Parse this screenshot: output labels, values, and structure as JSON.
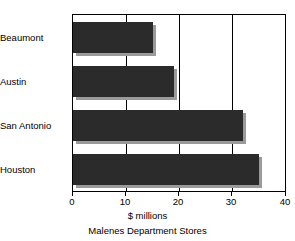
{
  "chart_data": {
    "type": "bar",
    "orientation": "horizontal",
    "title": "",
    "caption": "Malenes Department Stores",
    "xlabel": "$ millions",
    "ylabel": "",
    "categories": [
      "Beaumont",
      "Austin",
      "San Antonio",
      "Houston"
    ],
    "values": [
      15,
      19,
      32,
      35
    ],
    "xlim": [
      0,
      40
    ],
    "xticks": [
      0,
      10,
      20,
      30,
      40
    ],
    "xtick_labels": [
      "0",
      "10",
      "20",
      "30",
      "40"
    ],
    "grid": true,
    "grid_axis": "x",
    "legend": "none",
    "series": [
      {
        "name": "Sales",
        "values": [
          15,
          19,
          32,
          35
        ]
      }
    ],
    "colors": {
      "bar_fill": "#2b2b2b",
      "bar_shadow": "#9a9a9a",
      "axis": "#000000",
      "background": "#ffffff"
    }
  }
}
